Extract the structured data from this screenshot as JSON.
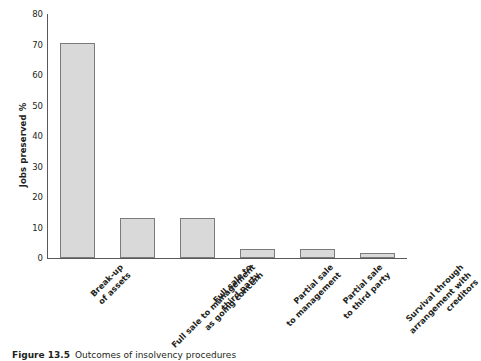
{
  "chart_data": {
    "type": "bar",
    "title": "",
    "xlabel": "",
    "ylabel": "Jobs preserved %",
    "ylim": [
      0,
      80
    ],
    "yticks": [
      0,
      10,
      20,
      30,
      40,
      50,
      60,
      70,
      80
    ],
    "grid": false,
    "legend": false,
    "categories": [
      "Break-up of assets",
      "Full sale to management as going concern",
      "Full sale to third party",
      "Partial sale to management",
      "Partial sale to third party",
      "Survival through arrangement with creditors"
    ],
    "category_lines": [
      [
        "Break-up",
        "of assets"
      ],
      [
        "Full sale to management",
        "as going concern"
      ],
      [
        "Full sale to",
        "third party"
      ],
      [
        "Partial sale",
        "to management"
      ],
      [
        "Partial sale",
        "to third party"
      ],
      [
        "Survival through",
        "arrangement with",
        "creditors"
      ]
    ],
    "values": [
      70.5,
      13,
      13,
      3,
      2.8,
      1.5
    ],
    "bar_fill": "#d9d9d9",
    "bar_edge": "#7b7b7b",
    "axis_color": "#58595b"
  },
  "caption": {
    "number": "Figure 13.5",
    "text": "Outcomes of insolvency procedures"
  }
}
